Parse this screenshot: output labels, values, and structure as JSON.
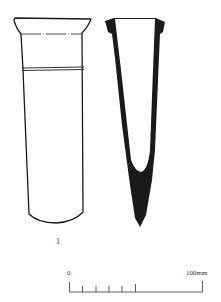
{
  "figure": {
    "object_number": "1",
    "views": [
      "external-elevation",
      "section"
    ],
    "ink_color": "#1a1a1a"
  },
  "scale_bar": {
    "start_label": "0",
    "end_label": "100mm",
    "subdivisions": 5,
    "subdivision_span_mm": 50
  }
}
